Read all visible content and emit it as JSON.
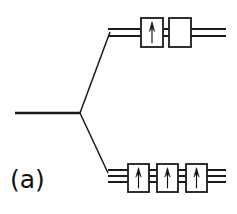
{
  "figure": {
    "panel_label": "(a)",
    "type": "orbital-energy-level-splitting-diagram",
    "colors": {
      "stroke": "#1a1a1a",
      "background": "#ffffff",
      "box_fill": "#ffffff",
      "arrow_fill": "#111111"
    },
    "geometry": {
      "width": 237,
      "height": 214,
      "vertex": {
        "x": 80,
        "y": 113
      }
    },
    "parent_level": {
      "name": "parent-level-line",
      "x1": 15,
      "y1": 113,
      "x2": 80,
      "y2": 113,
      "line_count": 1
    },
    "connectors": [
      {
        "name": "connector-up",
        "x1": 80,
        "y1": 113,
        "x2": 110,
        "y2": 32
      },
      {
        "name": "connector-down",
        "x1": 80,
        "y1": 113,
        "x2": 108,
        "y2": 173
      }
    ],
    "levels": [
      {
        "id": "upper-level",
        "name": "upper-energy-level",
        "position": "upper",
        "orbital_count": 2,
        "line_ys": [
          29,
          36
        ],
        "line_x_start": 108,
        "line_x_end": 226,
        "boxes": [
          {
            "id": "upper-orbital-1",
            "x": 141,
            "y": 18,
            "width": 22,
            "height": 29,
            "electrons": 1,
            "spins": [
              "up"
            ]
          },
          {
            "id": "upper-orbital-2",
            "x": 169,
            "y": 18,
            "width": 22,
            "height": 29,
            "electrons": 0,
            "spins": []
          }
        ]
      },
      {
        "id": "lower-level",
        "name": "lower-energy-level",
        "position": "lower",
        "orbital_count": 3,
        "line_ys": [
          170,
          176,
          182
        ],
        "line_x_start": 108,
        "line_x_end": 226,
        "boxes": [
          {
            "id": "lower-orbital-1",
            "x": 128,
            "y": 164,
            "width": 21,
            "height": 28,
            "electrons": 1,
            "spins": [
              "up"
            ]
          },
          {
            "id": "lower-orbital-2",
            "x": 157,
            "y": 164,
            "width": 21,
            "height": 28,
            "electrons": 1,
            "spins": [
              "up"
            ]
          },
          {
            "id": "lower-orbital-3",
            "x": 186,
            "y": 164,
            "width": 21,
            "height": 28,
            "electrons": 1,
            "spins": [
              "up"
            ]
          }
        ]
      }
    ]
  }
}
